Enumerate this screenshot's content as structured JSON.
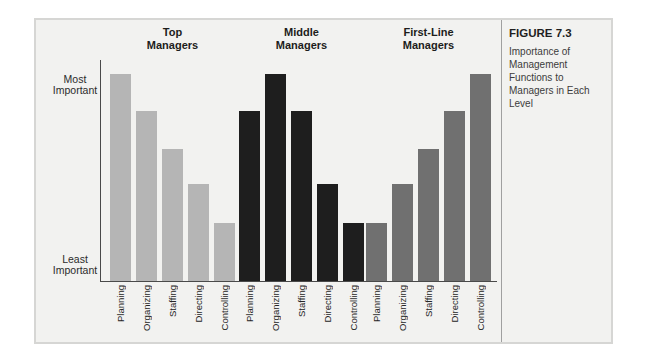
{
  "sidebar": {
    "figure_label": "FIGURE 7.3",
    "caption": "Importance of Management Functions to Managers in Each Level"
  },
  "chart_data": {
    "type": "bar",
    "title": "Importance of Management Functions to Managers in Each Level",
    "categories": [
      "Planning",
      "Organizing",
      "Staffing",
      "Directing",
      "Controlling"
    ],
    "series": [
      {
        "name": "Top Managers",
        "display_label": "Top\nManagers",
        "color": "#b5b5b5",
        "values": [
          100,
          82,
          64,
          47,
          28
        ]
      },
      {
        "name": "Middle Managers",
        "display_label": "Middle\nManagers",
        "color": "#1e1e1e",
        "values": [
          82,
          100,
          82,
          47,
          28
        ]
      },
      {
        "name": "First-Line Managers",
        "display_label": "First-Line\nManagers",
        "color": "#707070",
        "values": [
          28,
          47,
          64,
          82,
          100
        ]
      }
    ],
    "y_axis": {
      "top": [
        "Most",
        "Important"
      ],
      "bottom": [
        "Least",
        "Important"
      ],
      "scale_note": "Qualitative axis from Least Important to Most Important; values estimated 0-100 from relative bar heights"
    },
    "ylim": [
      0,
      100
    ],
    "grid": false,
    "legend": "none (series identified by group headers above bars)"
  },
  "colors": {
    "panel_background": "#f2f2f0",
    "panel_border": "#d6d6d4",
    "axis_line": "#4a4a4a",
    "divider_line": "#a0a0a0",
    "header_text": "#1d1d1b",
    "caption_text": "#3c3c3c"
  }
}
